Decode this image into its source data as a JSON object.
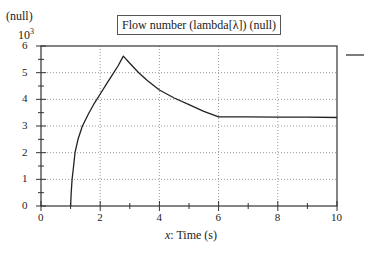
{
  "chart_data": {
    "type": "line",
    "title": "Flow number (lambda[λ]) (null)",
    "xlabel": "x: Time (s)",
    "xlabel_italic_part": "x",
    "xlabel_rest": ": Time (s)",
    "ylabel": "(null)",
    "y_multiplier": "10",
    "y_multiplier_exp": "3",
    "xlim": [
      0,
      10
    ],
    "ylim": [
      0,
      6
    ],
    "x_ticks": [
      "0",
      "2",
      "4",
      "6",
      "8",
      "10"
    ],
    "y_ticks": [
      "0",
      "1",
      "2",
      "3",
      "4",
      "5",
      "6"
    ],
    "grid": true,
    "legend": {
      "position": "right-top",
      "entries": [
        ""
      ]
    },
    "series": [
      {
        "name": "",
        "x": [
          1.0,
          1.02,
          1.05,
          1.1,
          1.15,
          1.25,
          1.4,
          1.6,
          1.8,
          2.0,
          2.2,
          2.4,
          2.6,
          2.78,
          3.0,
          3.3,
          3.6,
          4.0,
          4.5,
          5.0,
          5.5,
          6.0,
          7.0,
          8.0,
          9.0,
          10.0
        ],
        "values": [
          0.0,
          0.5,
          1.0,
          1.5,
          2.0,
          2.5,
          3.0,
          3.45,
          3.85,
          4.2,
          4.55,
          4.9,
          5.25,
          5.62,
          5.35,
          5.0,
          4.7,
          4.35,
          4.05,
          3.8,
          3.55,
          3.34,
          3.34,
          3.33,
          3.33,
          3.32
        ]
      }
    ]
  }
}
